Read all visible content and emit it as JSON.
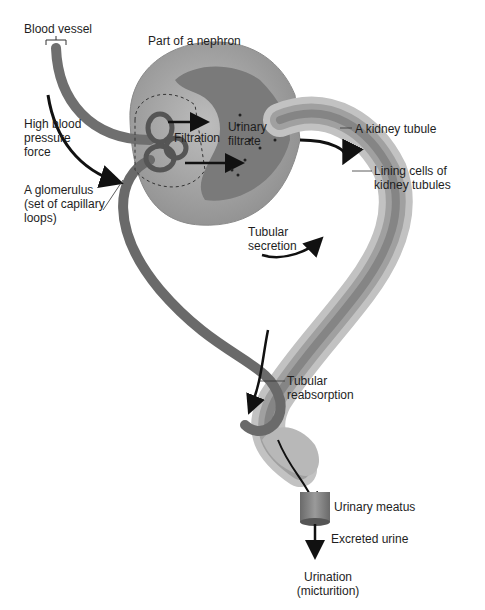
{
  "figure": {
    "type": "nephron-urine-formation-diagram",
    "colors": {
      "background": "#ffffff",
      "capsule": "#a9a9a9",
      "capsule_dark": "#8a8a8a",
      "tubule_wall": "#c4c4c4",
      "tubule_lumen": "#7d7d7d",
      "blood_vessel": "#6f6f6f",
      "arrow": "#111111",
      "text": "#1e1e1e"
    }
  },
  "labels": {
    "blood_vessel": "Blood vessel",
    "part_of_nephron": "Part of a nephron",
    "high_blood_pressure": "High blood pressure force",
    "filtration": "Filtration",
    "urinary_filtrate": "Urinary filtrate",
    "kidney_tubule": "A kidney tubule",
    "lining_cells": "Lining cells of kidney tubules",
    "glomerulus": "A glomerulus (set of capillary loops)",
    "tubular_secretion": "Tubular secretion",
    "tubular_reabsorption": "Tubular reabsorption",
    "urinary_meatus": "Urinary meatus",
    "excreted_urine": "Excreted urine",
    "urination": "Urination (micturition)"
  }
}
